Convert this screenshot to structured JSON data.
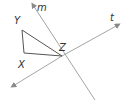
{
  "diagram": {
    "labels": {
      "m": "m",
      "t": "t",
      "x": "X",
      "y": "Y",
      "z": "Z"
    },
    "colors": {
      "line": "#9a9a9a",
      "triangle": "#555555",
      "text": "#333333"
    }
  }
}
